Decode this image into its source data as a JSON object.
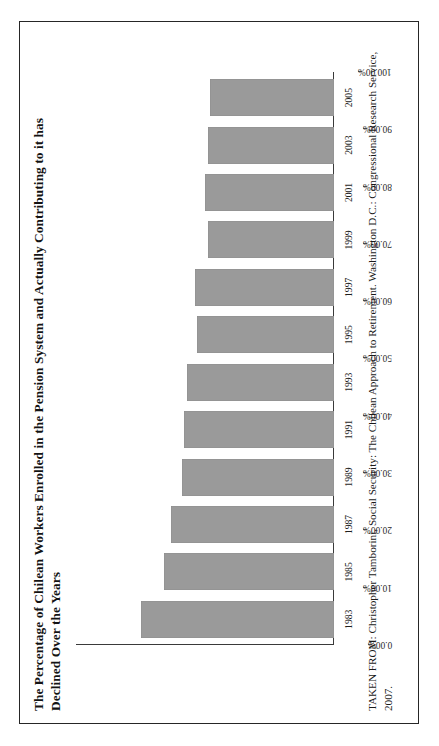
{
  "figure": {
    "title": "The Percentage of Chilean Workers Enrolled in the Pension System and Actually Contributing to it has Declined Over the Years",
    "source": "TAKEN FROM: Christopher Tamborini, Social Security: The Chilean Approach to Retirement. Washington D.C.: Congressional Research Service, 2007.",
    "bar_color": "#9a9a9a",
    "frame_color": "#262626",
    "axis_color": "#3a3a3a"
  },
  "chart_data": {
    "type": "bar",
    "orientation": "vertical-rotated",
    "title": "The Percentage of Chilean Workers Enrolled in the Pension System and Actually Contributing to it has Declined Over the Years",
    "xlabel": "",
    "ylabel": "",
    "categories": [
      "1983",
      "1985",
      "1987",
      "1989",
      "1991",
      "1993",
      "1995",
      "1997",
      "1999",
      "2001",
      "2003",
      "2005"
    ],
    "values": [
      75,
      66,
      63,
      59,
      58,
      57,
      53,
      54,
      49,
      50,
      49,
      48
    ],
    "value_labels": [
      "75.00%",
      "66.00%",
      "63.00%",
      "59.00%",
      "58.00%",
      "57.00%",
      "53.00%",
      "54.00%",
      "49.00%",
      "50.00%",
      "49.00%",
      "48.00%"
    ],
    "ylim": [
      0,
      100
    ],
    "ytick_values": [
      100,
      90,
      80,
      70,
      60,
      50,
      40,
      30,
      20,
      10,
      0
    ],
    "ytick_labels": [
      "100.00%",
      "90.00%",
      "80.00%",
      "70.00%",
      "60.00%",
      "50.00%",
      "40.00%",
      "30.00%",
      "20.00%",
      "10.00%",
      "0.00%"
    ],
    "grid": false,
    "legend": null,
    "legend_position": "none",
    "series": [
      {
        "name": "Percentage of enrolled workers actually contributing",
        "values": [
          75,
          66,
          63,
          59,
          58,
          57,
          53,
          54,
          49,
          50,
          49,
          48
        ]
      }
    ]
  }
}
